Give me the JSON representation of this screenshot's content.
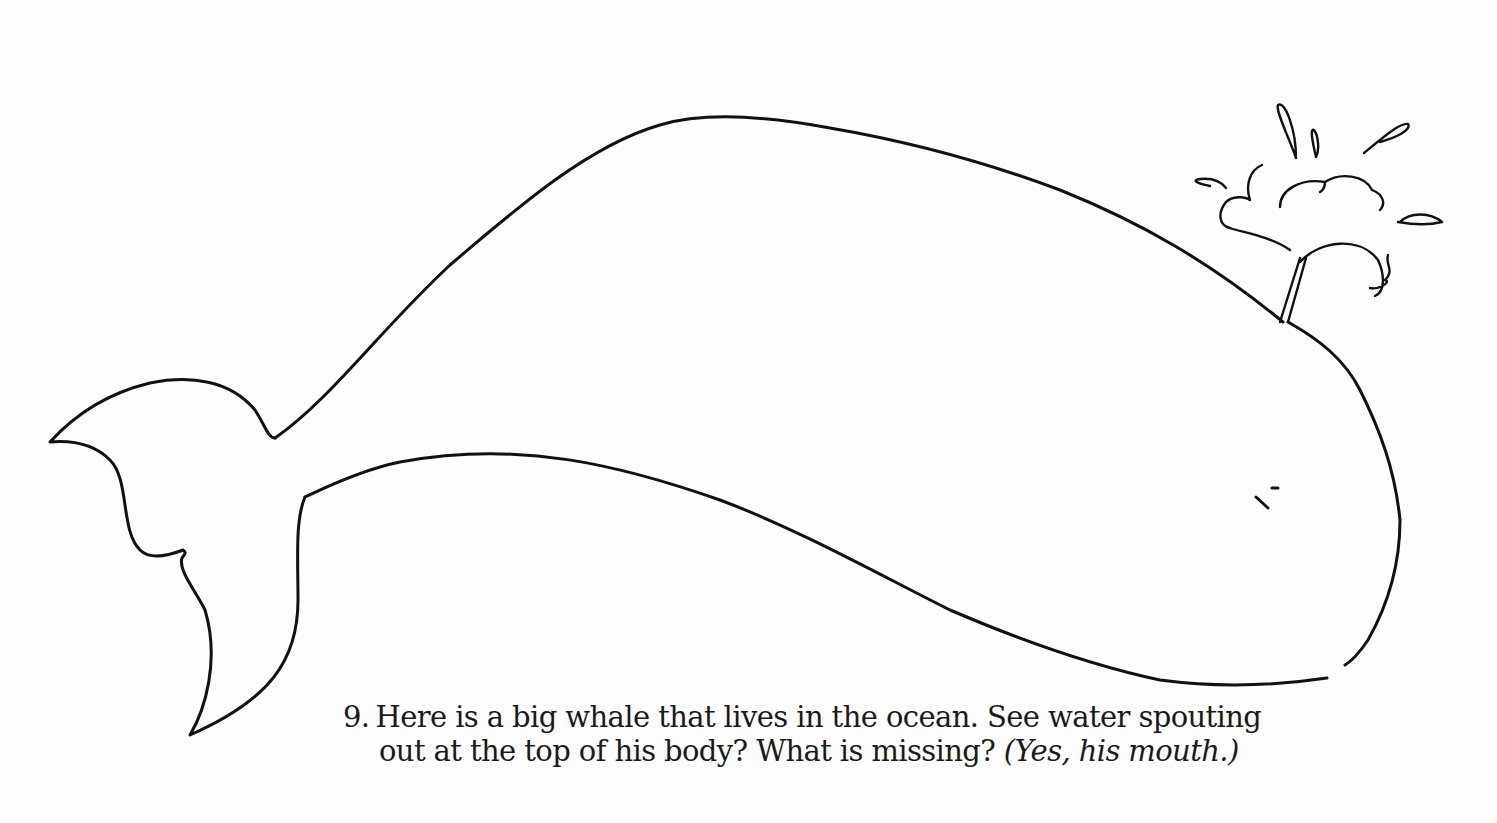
{
  "illustration": {
    "subject": "whale-outline",
    "parts": [
      "body",
      "tail-fluke",
      "water-spout",
      "eye"
    ],
    "missing_part": "mouth"
  },
  "caption": {
    "number": "9.",
    "line1": "Here is a big whale that lives in the ocean. See water spouting",
    "line2_main": "out at the top of his body? What is missing?",
    "line2_answer": "(Yes, his mouth.)"
  },
  "colors": {
    "ink": "#111111",
    "paper": "#fdfdfd"
  }
}
